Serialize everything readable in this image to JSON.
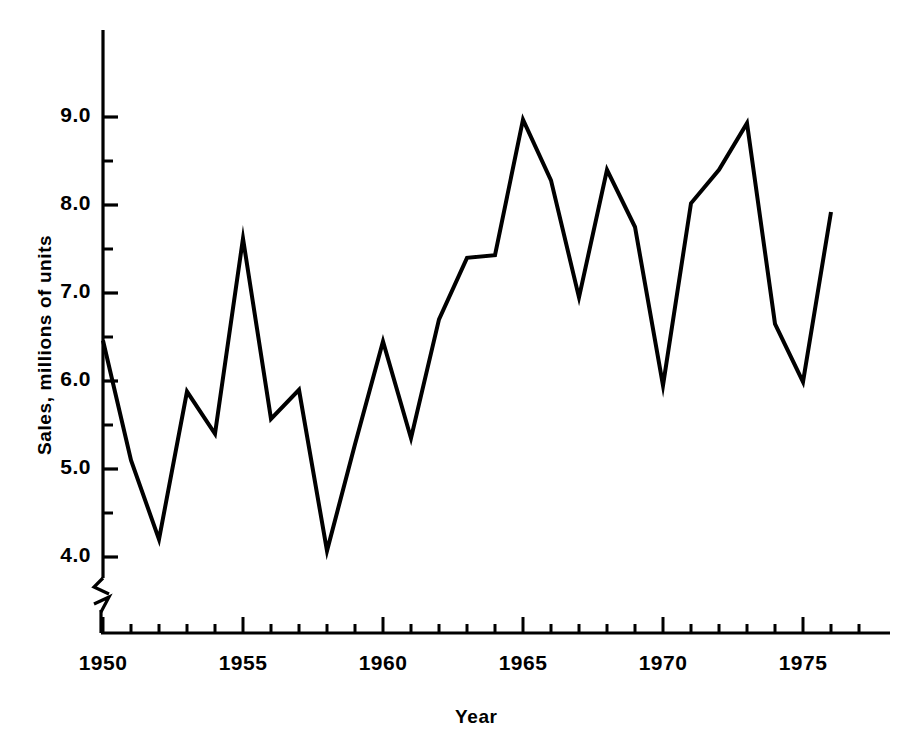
{
  "chart_data": {
    "type": "line",
    "title": "",
    "xlabel": "Year",
    "ylabel": "Sales, millions of units",
    "xlim": [
      1950,
      1977
    ],
    "ylim": [
      3.5,
      9.6
    ],
    "y_axis_break": true,
    "grid": false,
    "legend": null,
    "x_major_ticks": [
      1950,
      1955,
      1960,
      1965,
      1970,
      1975
    ],
    "x_major_tick_labels": [
      "1950",
      "1955",
      "1960",
      "1965",
      "1970",
      "1975"
    ],
    "x_minor_tick_step": 1,
    "y_major_ticks": [
      4.0,
      5.0,
      6.0,
      7.0,
      8.0,
      9.0
    ],
    "y_major_tick_labels": [
      "4.0",
      "5.0",
      "6.0",
      "7.0",
      "8.0",
      "9.0"
    ],
    "y_minor_ticks": [
      4.5,
      5.5,
      6.5,
      7.5,
      8.5
    ],
    "line_color": "#000000",
    "line_width": 4,
    "x": [
      1950,
      1951,
      1952,
      1953,
      1954,
      1955,
      1956,
      1957,
      1958,
      1959,
      1960,
      1961,
      1962,
      1963,
      1964,
      1965,
      1966,
      1967,
      1968,
      1969,
      1970,
      1971,
      1972,
      1973,
      1974,
      1975,
      1976
    ],
    "values": [
      6.46,
      5.1,
      4.2,
      5.88,
      5.4,
      7.62,
      5.57,
      5.9,
      4.07,
      5.28,
      6.45,
      5.35,
      6.7,
      7.4,
      7.43,
      8.97,
      8.28,
      6.95,
      8.4,
      7.75,
      5.95,
      8.02,
      8.4,
      8.93,
      6.65,
      5.99,
      7.92
    ],
    "categories": [
      "1950",
      "1951",
      "1952",
      "1953",
      "1954",
      "1955",
      "1956",
      "1957",
      "1958",
      "1959",
      "1960",
      "1961",
      "1962",
      "1963",
      "1964",
      "1965",
      "1966",
      "1967",
      "1968",
      "1969",
      "1970",
      "1971",
      "1972",
      "1973",
      "1974",
      "1975",
      "1976"
    ],
    "series": [
      {
        "name": "Sales",
        "values": [
          6.46,
          5.1,
          4.2,
          5.88,
          5.4,
          7.62,
          5.57,
          5.9,
          4.07,
          5.28,
          6.45,
          5.35,
          6.7,
          7.4,
          7.43,
          8.97,
          8.28,
          6.95,
          8.4,
          7.75,
          5.95,
          8.02,
          8.4,
          8.93,
          6.65,
          5.99,
          7.92
        ]
      }
    ]
  }
}
